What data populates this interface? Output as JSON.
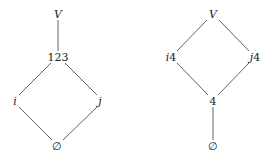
{
  "diagrams": [
    {
      "name": "left-lattice",
      "nodes": [
        {
          "id": "V",
          "label": "V",
          "italic": true,
          "x": 58,
          "y": 14
        },
        {
          "id": "123",
          "label": "123",
          "italic": false,
          "x": 58,
          "y": 57
        },
        {
          "id": "i",
          "label": "i",
          "italic": true,
          "x": 15,
          "y": 101
        },
        {
          "id": "j",
          "label": "j",
          "italic": true,
          "x": 100,
          "y": 101
        },
        {
          "id": "empty",
          "label": "∅",
          "italic": false,
          "x": 57,
          "y": 146
        }
      ],
      "edges": [
        [
          "V",
          "123"
        ],
        [
          "123",
          "i"
        ],
        [
          "123",
          "j"
        ],
        [
          "i",
          "empty"
        ],
        [
          "j",
          "empty"
        ]
      ]
    },
    {
      "name": "right-lattice",
      "nodes": [
        {
          "id": "V",
          "label": "V",
          "italic": true,
          "x": 213,
          "y": 14
        },
        {
          "id": "i4",
          "label": "i4",
          "italic": true,
          "x": 171,
          "y": 57
        },
        {
          "id": "j4",
          "label": "j4",
          "italic": true,
          "x": 255,
          "y": 57
        },
        {
          "id": "4",
          "label": "4",
          "italic": false,
          "x": 213,
          "y": 101
        },
        {
          "id": "empty",
          "label": "∅",
          "italic": false,
          "x": 213,
          "y": 146
        }
      ],
      "edges": [
        [
          "V",
          "i4"
        ],
        [
          "V",
          "j4"
        ],
        [
          "i4",
          "4"
        ],
        [
          "j4",
          "4"
        ],
        [
          "4",
          "empty"
        ]
      ]
    }
  ],
  "labels": {
    "left": {
      "top": "V",
      "middle": "123",
      "left": "i",
      "right": "j",
      "bottom": "∅"
    },
    "right": {
      "top": "V",
      "left": "i",
      "left_suffix": "4",
      "right": "j",
      "right_suffix": "4",
      "middle": "4",
      "bottom": "∅"
    }
  },
  "colors": {
    "background": "#ffffff",
    "edge": "#3a3a3a",
    "text": "#222222"
  }
}
